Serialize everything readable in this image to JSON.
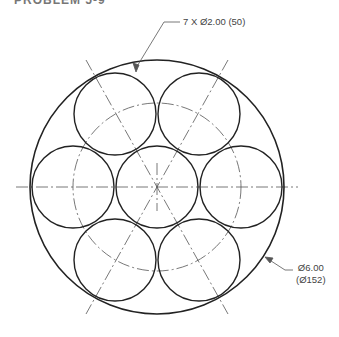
{
  "heading": {
    "text": "PROBLEM 5-9"
  },
  "callouts": {
    "small_circles": "7 X Ø2.00 (50)",
    "outer_diameter_in": "Ø6.00",
    "outer_diameter_mm": "(Ø152)"
  },
  "drawing": {
    "center": [
      157,
      187
    ],
    "outer_radius": 127,
    "small_radius": 42,
    "pitch_radius": 84,
    "small_circle_count": 7,
    "line_color": "#222222",
    "centerline_color": "#555555"
  }
}
